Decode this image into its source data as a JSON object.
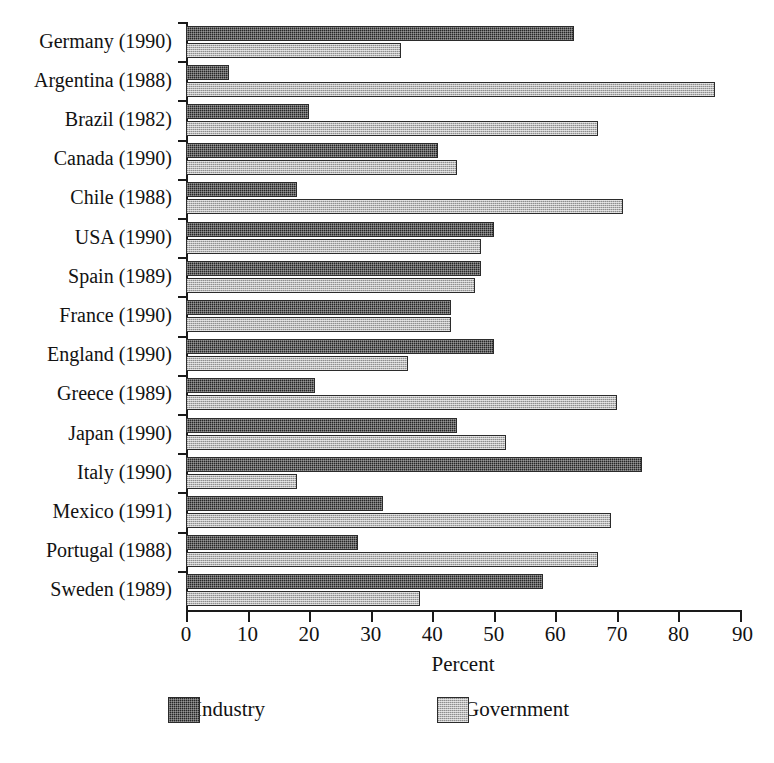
{
  "chart_data": {
    "type": "bar",
    "orientation": "horizontal",
    "title": "",
    "xlabel": "Percent",
    "ylabel": "",
    "xlim": [
      0,
      90
    ],
    "xticks": [
      0,
      10,
      20,
      30,
      40,
      50,
      60,
      70,
      80,
      90
    ],
    "xtick_labels": [
      "0",
      "10",
      "20",
      "30",
      "40",
      "50",
      "60",
      "70",
      "80",
      "90"
    ],
    "grid": false,
    "legend_position": "bottom",
    "categories": [
      "Germany (1990)",
      "Argentina (1988)",
      "Brazil (1982)",
      "Canada (1990)",
      "Chile (1988)",
      "USA (1990)",
      "Spain (1989)",
      "France (1990)",
      "England (1990)",
      "Greece (1989)",
      "Japan (1990)",
      "Italy (1990)",
      "Mexico (1991)",
      "Portugal (1988)",
      "Sweden (1989)"
    ],
    "series": [
      {
        "name": "Industry",
        "color": "#262626",
        "pattern": "dark-checker",
        "values": [
          63,
          7,
          20,
          41,
          18,
          50,
          48,
          43,
          50,
          21,
          44,
          74,
          32,
          28,
          58
        ]
      },
      {
        "name": "Government",
        "color": "#b9b9b9",
        "pattern": "light-checker",
        "values": [
          35,
          86,
          67,
          44,
          71,
          48,
          47,
          43,
          36,
          70,
          52,
          18,
          69,
          67,
          38
        ]
      }
    ]
  },
  "legend": {
    "items": [
      {
        "label": "Industry",
        "color": "#262626"
      },
      {
        "label": "Government",
        "color": "#b9b9b9"
      }
    ]
  },
  "axis": {
    "x_axis_title": "Percent"
  }
}
